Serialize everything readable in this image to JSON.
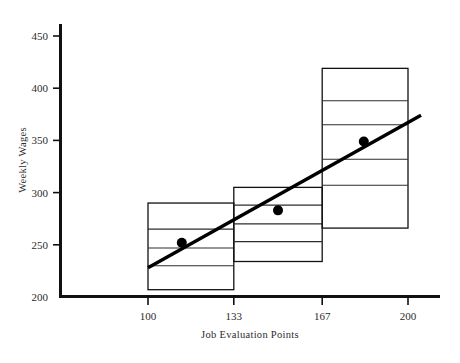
{
  "chart_data": {
    "type": "bar",
    "title": "",
    "xlabel": "Job Evaluation Points",
    "ylabel": "Weekly Wages",
    "xlim": [
      81,
      212
    ],
    "ylim": [
      200,
      462
    ],
    "xticks": [
      100,
      133,
      167,
      200
    ],
    "xtick_labels": [
      "100",
      "133",
      "167",
      "200"
    ],
    "yticks": [
      200,
      250,
      300,
      350,
      400,
      450
    ],
    "ytick_labels": [
      "200",
      "250",
      "300",
      "350",
      "400",
      "450"
    ],
    "grid": false,
    "legend": "none",
    "series": [
      {
        "name": "Wage range boxes",
        "type": "range-box",
        "boxes": [
          {
            "label": "Grade 1",
            "x_start": 100,
            "x_end": 133,
            "top": 290,
            "bottom": 207,
            "internal_lines": [
              265,
              247,
              230
            ]
          },
          {
            "label": "Grade 2",
            "x_start": 133,
            "x_end": 167,
            "top": 305,
            "bottom": 234,
            "internal_lines": [
              288,
              270,
              253
            ]
          },
          {
            "label": "Grade 3",
            "x_start": 167,
            "x_end": 200,
            "top": 419,
            "bottom": 266,
            "internal_lines": [
              388,
              365,
              332,
              307
            ]
          }
        ]
      },
      {
        "name": "Midpoint wage",
        "type": "scatter",
        "points": [
          {
            "x": 113,
            "y": 252
          },
          {
            "x": 150,
            "y": 283
          },
          {
            "x": 183,
            "y": 349
          }
        ]
      },
      {
        "name": "Wage trend line",
        "type": "line",
        "points": [
          {
            "x": 100,
            "y": 228
          },
          {
            "x": 205,
            "y": 374
          }
        ]
      }
    ]
  },
  "axis": {
    "y_title": "Weekly Wages",
    "x_title": "Job Evaluation Points"
  },
  "figure": {
    "caption": ""
  }
}
